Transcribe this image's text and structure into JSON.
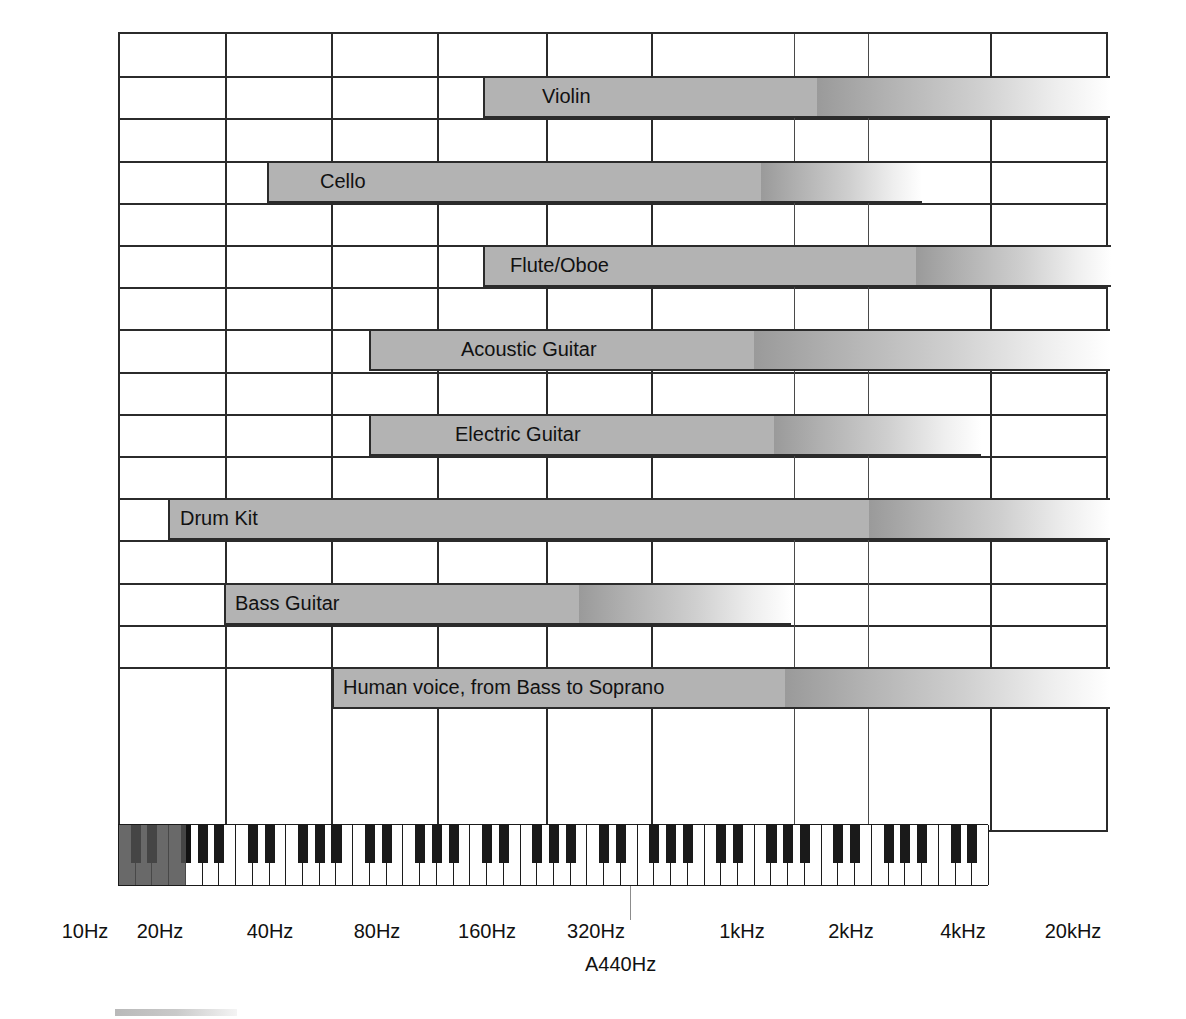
{
  "figure": {
    "grid_color": "#2b2b2b",
    "bar_color": "#b3b3b3"
  },
  "axis": {
    "label_a440": "A440Hz",
    "ticks": [
      {
        "label": "10Hz",
        "x": 85
      },
      {
        "label": "20Hz",
        "x": 160
      },
      {
        "label": "40Hz",
        "x": 270
      },
      {
        "label": "80Hz",
        "x": 377
      },
      {
        "label": "160Hz",
        "x": 487
      },
      {
        "label": "320Hz",
        "x": 596
      },
      {
        "label": "1kHz",
        "x": 742
      },
      {
        "label": "2kHz",
        "x": 851
      },
      {
        "label": "4kHz",
        "x": 963
      },
      {
        "label": "20kHz",
        "x": 1073
      }
    ]
  },
  "chart_data": {
    "type": "bar",
    "xlabel": "Frequency (log scale)",
    "ylabel": "",
    "xscale": "log",
    "xlim": [
      10,
      20000
    ],
    "grid": true,
    "legend": "none",
    "axis_ticks": [
      "10Hz",
      "20Hz",
      "40Hz",
      "80Hz",
      "160Hz",
      "320Hz",
      "1kHz",
      "2kHz",
      "4kHz",
      "20kHz"
    ],
    "annotations": [
      "A440Hz"
    ],
    "categories": [
      "Violin",
      "Cello",
      "Flute/Oboe",
      "Acoustic Guitar",
      "Electric Guitar",
      "Drum Kit",
      "Bass Guitar",
      "Human voice, from Bass to Soprano"
    ],
    "series": [
      {
        "name": "fundamental range (solid)",
        "note": "solid grey portion of each bar",
        "values": [
          {
            "label": "Violin",
            "start_hz": 196,
            "end_hz": 3100
          },
          {
            "label": "Cello",
            "start_hz": 65,
            "end_hz": 700
          },
          {
            "label": "Flute/Oboe",
            "start_hz": 200,
            "end_hz": 2000
          },
          {
            "label": "Acoustic Guitar",
            "start_hz": 82,
            "end_hz": 1100
          },
          {
            "label": "Electric Guitar",
            "start_hz": 82,
            "end_hz": 1250
          },
          {
            "label": "Drum Kit",
            "start_hz": 25,
            "end_hz": 2200
          },
          {
            "label": "Bass Guitar",
            "start_hz": 41,
            "end_hz": 300
          },
          {
            "label": "Human voice, from Bass to Soprano",
            "start_hz": 80,
            "end_hz": 1400
          }
        ]
      },
      {
        "name": "harmonics / overtones (fading)",
        "note": "gradient tail extending beyond the solid portion",
        "values": [
          {
            "label": "Violin",
            "end_hz": 20000
          },
          {
            "label": "Cello",
            "end_hz": 6000
          },
          {
            "label": "Flute/Oboe",
            "end_hz": 8000
          },
          {
            "label": "Acoustic Guitar",
            "end_hz": 20000
          },
          {
            "label": "Electric Guitar",
            "end_hz": 6500
          },
          {
            "label": "Drum Kit",
            "end_hz": 20000
          },
          {
            "label": "Bass Guitar",
            "end_hz": 2000
          },
          {
            "label": "Human voice, from Bass to Soprano",
            "end_hz": 12000
          }
        ]
      }
    ]
  },
  "bars": [
    {
      "name": "violin",
      "label": "Violin",
      "row": 1,
      "solid_x": 481,
      "solid_w": 334,
      "fade_w": 293,
      "text_x": 540
    },
    {
      "name": "cello",
      "label": "Cello",
      "row": 3,
      "solid_x": 265,
      "solid_w": 494,
      "fade_w": 161,
      "text_x": 318
    },
    {
      "name": "flute-oboe",
      "label": "Flute/Oboe",
      "row": 5,
      "solid_x": 481,
      "solid_w": 433,
      "fade_w": 195,
      "text_x": 508
    },
    {
      "name": "acoustic-guitar",
      "label": "Acoustic Guitar",
      "row": 7,
      "solid_x": 367,
      "solid_w": 385,
      "fade_w": 356,
      "text_x": 459
    },
    {
      "name": "electric-guitar",
      "label": "Electric Guitar",
      "row": 9,
      "solid_x": 367,
      "solid_w": 405,
      "fade_w": 207,
      "text_x": 453
    },
    {
      "name": "drum-kit",
      "label": "Drum Kit",
      "row": 11,
      "solid_x": 166,
      "solid_w": 701,
      "fade_w": 241,
      "text_x": 178
    },
    {
      "name": "bass-guitar",
      "label": "Bass Guitar",
      "row": 13,
      "solid_x": 222,
      "solid_w": 355,
      "fade_w": 212,
      "text_x": 233
    },
    {
      "name": "human-voice",
      "label": "Human voice, from Bass to Soprano",
      "row": 15,
      "solid_x": 330,
      "solid_w": 453,
      "fade_w": 325,
      "text_x": 341
    }
  ]
}
